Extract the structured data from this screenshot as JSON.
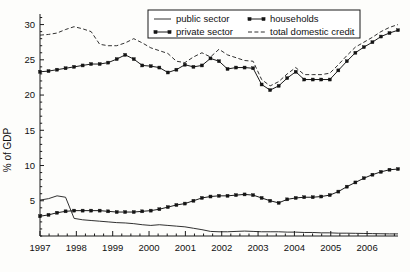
{
  "chart_data": {
    "type": "line",
    "title": "",
    "subtitle": "",
    "xlabel": "",
    "ylabel": "% of GDP",
    "xlim": [
      1997.0,
      2006.85
    ],
    "ylim": [
      0,
      31.5
    ],
    "yticks": [
      5,
      10,
      15,
      20,
      25,
      30
    ],
    "xticks": [
      1997,
      1998,
      1999,
      2000,
      2001,
      2002,
      2003,
      2004,
      2005,
      2006,
      2007
    ],
    "xtick_labels": [
      "1997",
      "1998",
      "1999",
      "2000",
      "2001",
      "2002",
      "2003",
      "2004",
      "2005",
      "2006",
      "2007"
    ],
    "ytick_labels": [
      "5",
      "10",
      "15",
      "20",
      "25",
      "30"
    ],
    "grid": false,
    "minor_ticks": "quarterly",
    "legend_position": "top-center",
    "x": [
      1997.0,
      1997.25,
      1997.5,
      1997.75,
      1998.0,
      1998.25,
      1998.5,
      1998.75,
      1999.0,
      1999.25,
      1999.5,
      1999.75,
      2000.0,
      2000.25,
      2000.5,
      2000.75,
      2001.0,
      2001.25,
      2001.5,
      2001.75,
      2002.0,
      2002.25,
      2002.5,
      2002.75,
      2003.0,
      2003.25,
      2003.5,
      2003.75,
      2004.0,
      2004.25,
      2004.5,
      2004.75,
      2005.0,
      2005.25,
      2005.5,
      2005.75,
      2006.0,
      2006.25,
      2006.5,
      2006.75
    ],
    "series": [
      {
        "name": "public sector",
        "style": "solid-thin",
        "marker": "none",
        "values": [
          5.1,
          5.3,
          5.7,
          5.5,
          2.5,
          2.3,
          2.2,
          2.1,
          2.0,
          1.9,
          1.85,
          1.75,
          1.6,
          1.5,
          1.6,
          1.5,
          1.4,
          1.3,
          1.1,
          0.9,
          0.65,
          0.6,
          0.6,
          0.65,
          0.7,
          0.65,
          0.6,
          0.6,
          0.6,
          0.55,
          0.55,
          0.5,
          0.5,
          0.45,
          0.45,
          0.4,
          0.4,
          0.35,
          0.35,
          0.3
        ]
      },
      {
        "name": "private sector",
        "style": "solid-marker",
        "marker": "square",
        "values": [
          2.8,
          3.0,
          3.3,
          3.5,
          3.6,
          3.6,
          3.6,
          3.6,
          3.5,
          3.4,
          3.4,
          3.4,
          3.5,
          3.6,
          3.8,
          4.1,
          4.4,
          4.6,
          5.0,
          5.4,
          5.6,
          5.7,
          5.7,
          5.8,
          5.9,
          5.8,
          5.4,
          5.0,
          4.7,
          5.0,
          5.2,
          5.4,
          5.5,
          5.5,
          5.6,
          5.8,
          6.3,
          6.9,
          7.5,
          8.1
        ]
      },
      {
        "name": "households",
        "style": "solid-marker",
        "marker": "square",
        "values": [
          23.3,
          23.4,
          23.6,
          23.8,
          24.0,
          24.2,
          24.4,
          24.4,
          24.6,
          25.1,
          25.7,
          25.1,
          24.2,
          24.1,
          23.9,
          23.2,
          23.6,
          24.3,
          24.0,
          24.2,
          24.8,
          25.2,
          24.6,
          24.4,
          23.7,
          23.6,
          23.9,
          23.9,
          23.8,
          23.8,
          22.9,
          21.5,
          21.2,
          20.7,
          21.3,
          22.0,
          22.6,
          23.3,
          22.9,
          22.2
        ]
      },
      {
        "name": "total domestic credit",
        "style": "dashed",
        "marker": "none",
        "values": [
          28.5,
          28.6,
          28.8,
          29.3,
          29.7,
          29.4,
          29.0,
          27.2,
          27.0,
          27.0,
          27.4,
          28.0,
          27.4,
          26.7,
          26.3,
          25.9,
          24.8,
          24.6,
          25.4,
          26.0,
          25.4,
          25.3,
          26.0,
          26.5,
          25.7,
          25.3,
          25.2,
          25.0,
          24.9,
          24.8,
          24.6,
          24.5,
          23.6,
          22.0,
          21.7,
          22.2,
          22.9,
          23.5,
          23.4,
          23.2
        ]
      }
    ],
    "series_tail": {
      "note": "private sector continues to 9.5; households to 29.2; total domestic credit to 30.0 at 2006.75"
    },
    "private_full": [
      2.8,
      3.0,
      3.3,
      3.5,
      3.6,
      3.6,
      3.6,
      3.6,
      3.5,
      3.4,
      3.4,
      3.4,
      3.5,
      3.6,
      3.8,
      4.1,
      4.4,
      4.6,
      5.0,
      5.4,
      5.6,
      5.7,
      5.7,
      5.8,
      5.9,
      5.8,
      5.4,
      5.0,
      4.7,
      5.2,
      5.4,
      5.5,
      5.5,
      5.6,
      5.8,
      6.3,
      7.0,
      7.6,
      8.2,
      8.7,
      9.1,
      9.4,
      9.5
    ],
    "households_full": [
      23.3,
      23.4,
      23.6,
      23.8,
      24.0,
      24.2,
      24.4,
      24.4,
      24.6,
      25.1,
      25.7,
      25.1,
      24.2,
      24.1,
      23.9,
      23.2,
      23.6,
      24.3,
      24.0,
      24.2,
      25.2,
      24.8,
      23.7,
      23.9,
      23.9,
      23.8,
      21.5,
      20.7,
      21.3,
      22.4,
      23.3,
      22.2,
      22.2,
      22.2,
      22.2,
      23.5,
      24.8,
      26.0,
      26.8,
      27.5,
      28.3,
      28.8,
      29.2
    ],
    "total_full": [
      28.5,
      28.6,
      28.8,
      29.3,
      29.7,
      29.4,
      29.0,
      27.2,
      27.0,
      27.0,
      27.4,
      28.0,
      27.4,
      26.7,
      26.3,
      25.9,
      24.8,
      24.6,
      25.4,
      26.0,
      25.4,
      26.5,
      25.7,
      25.3,
      24.9,
      24.8,
      22.2,
      21.3,
      21.9,
      23.0,
      23.9,
      22.9,
      22.9,
      22.9,
      23.1,
      24.3,
      25.6,
      26.8,
      27.5,
      28.2,
      29.0,
      29.6,
      30.0
    ],
    "public_full": [
      5.1,
      5.3,
      5.7,
      5.5,
      2.5,
      2.3,
      2.2,
      2.1,
      2.0,
      1.9,
      1.85,
      1.75,
      1.6,
      1.5,
      1.6,
      1.5,
      1.4,
      1.3,
      1.1,
      0.9,
      0.65,
      0.6,
      0.6,
      0.65,
      0.7,
      0.65,
      0.6,
      0.6,
      0.6,
      0.55,
      0.55,
      0.5,
      0.5,
      0.45,
      0.45,
      0.4,
      0.4,
      0.38,
      0.36,
      0.34,
      0.32,
      0.3,
      0.3
    ]
  },
  "legend": {
    "entries": [
      {
        "label": "public sector",
        "style": "solid-thin"
      },
      {
        "label": "households",
        "style": "marker-line"
      },
      {
        "label": "private sector",
        "style": "marker-line"
      },
      {
        "label": "total domestic credit",
        "style": "dashed"
      }
    ]
  },
  "axes": {
    "ylabel": "% of GDP"
  },
  "colors": {
    "ink": "#1a1a1a",
    "background": "#fdfdfb"
  }
}
